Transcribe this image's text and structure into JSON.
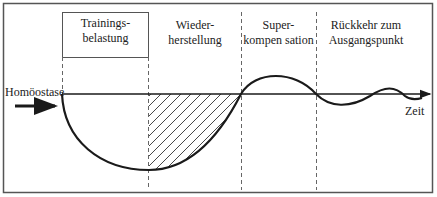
{
  "diagram": {
    "phases": [
      {
        "id": "training",
        "line1": "Trainings-",
        "line2": "belastung"
      },
      {
        "id": "recovery",
        "line1": "Wieder-",
        "line2": "herstellung"
      },
      {
        "id": "supercomp",
        "line1": "Super-",
        "line2": "kompen sation"
      },
      {
        "id": "return",
        "line1": "Rückkehr zum",
        "line2": "Ausgangspunkt"
      }
    ],
    "baseline_label": "Homöostase",
    "time_axis_label": "Zeit"
  },
  "colors": {
    "line": "#1a1a1a",
    "frame": "#555555",
    "dashed": "#555555",
    "background": "#ffffff"
  }
}
